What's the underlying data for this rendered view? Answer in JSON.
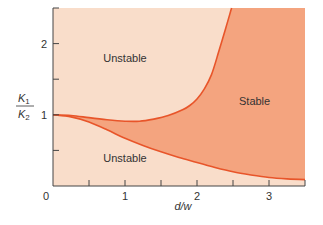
{
  "chart_data": {
    "type": "area",
    "title": "",
    "xlabel": "d/w",
    "ylabel_numerator": "K",
    "ylabel_numerator_sub": "1",
    "ylabel_denominator": "K",
    "ylabel_denominator_sub": "2",
    "xlim": [
      0,
      3.5
    ],
    "ylim": [
      0,
      2.5
    ],
    "xticks_major": [
      0,
      1,
      2,
      3
    ],
    "xticks_minor": [
      0.5,
      1.5,
      2.5,
      3.5
    ],
    "xtick_labels": [
      "0",
      "1",
      "2",
      "3"
    ],
    "yticks_major": [
      1,
      2
    ],
    "yticks_minor": [
      0.5,
      1.5,
      2.5
    ],
    "ytick_labels": [
      "1",
      "2"
    ],
    "grid": false,
    "series": [
      {
        "name": "upper boundary",
        "x": [
          0,
          0.25,
          0.5,
          0.75,
          1.0,
          1.2,
          1.4,
          1.6,
          1.8,
          1.9,
          2.0,
          2.1,
          2.2,
          2.3,
          2.4,
          2.48
        ],
        "y": [
          1.0,
          0.99,
          0.96,
          0.93,
          0.91,
          0.91,
          0.94,
          0.99,
          1.07,
          1.13,
          1.22,
          1.36,
          1.56,
          1.88,
          2.22,
          2.5
        ]
      },
      {
        "name": "lower boundary",
        "x": [
          0,
          0.25,
          0.5,
          0.75,
          1.0,
          1.25,
          1.5,
          1.75,
          2.0,
          2.25,
          2.5,
          2.75,
          3.0,
          3.25,
          3.5
        ],
        "y": [
          1.0,
          0.97,
          0.9,
          0.79,
          0.67,
          0.57,
          0.48,
          0.4,
          0.33,
          0.26,
          0.2,
          0.155,
          0.12,
          0.1,
          0.09
        ]
      }
    ],
    "regions": [
      {
        "label": "Unstable",
        "position": "upper-left",
        "x": 1.0,
        "y": 1.8
      },
      {
        "label": "Stable",
        "position": "right",
        "x": 2.8,
        "y": 1.2
      },
      {
        "label": "Unstable",
        "position": "lower-left",
        "x": 1.0,
        "y": 0.4
      }
    ],
    "colors": {
      "unstable_fill": "#f9ddca",
      "stable_fill": "#f4a47f",
      "boundary_line": "#e8552a",
      "axis": "#444444",
      "text": "#333333"
    }
  }
}
